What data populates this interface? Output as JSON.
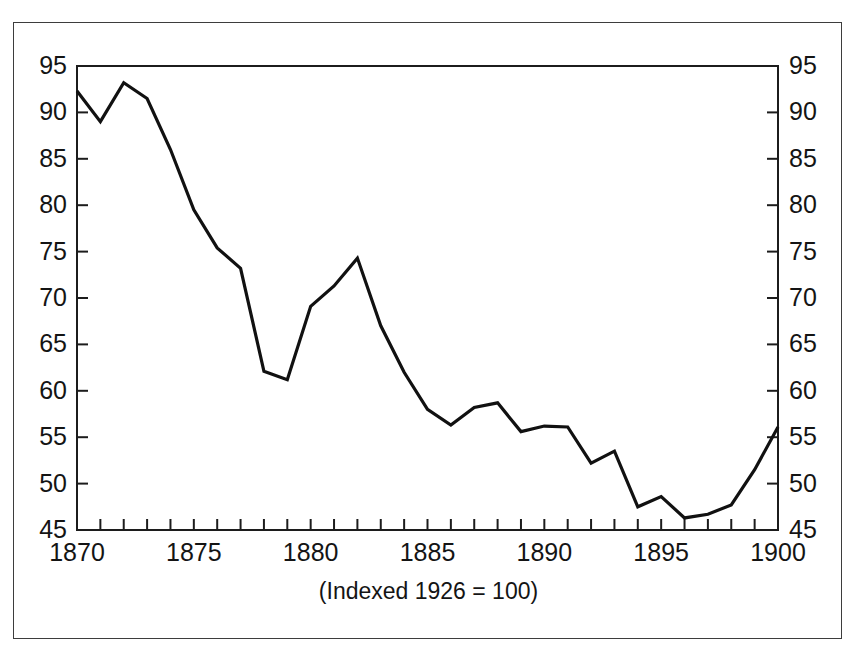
{
  "chart_data": {
    "type": "line",
    "title": "",
    "subtitle": "",
    "caption": "(Indexed 1926 = 100)",
    "xlabel": "",
    "ylabel": "",
    "xlim": [
      1870,
      1900
    ],
    "ylim": [
      45,
      95
    ],
    "grid": false,
    "legend": null,
    "legend_position": "none",
    "line_color": "#111111",
    "line_width": 3.2,
    "x_major_ticks": [
      1870,
      1875,
      1880,
      1885,
      1890,
      1895,
      1900
    ],
    "x_major_tick_labels": [
      "1870",
      "1875",
      "1880",
      "1885",
      "1890",
      "1895",
      "1900"
    ],
    "x_minor_tick_step": 1,
    "y_ticks": [
      45,
      50,
      55,
      60,
      65,
      70,
      75,
      80,
      85,
      90,
      95
    ],
    "y_tick_labels_left": [
      "45",
      "50",
      "55",
      "60",
      "65",
      "70",
      "75",
      "80",
      "85",
      "90",
      "95"
    ],
    "y_tick_labels_right": [
      "45",
      "50",
      "55",
      "60",
      "65",
      "70",
      "75",
      "80",
      "85",
      "90",
      "95"
    ],
    "axes": {
      "left_axis": "visible",
      "right_axis": "visible",
      "top_axis": "visible",
      "bottom_axis": "visible"
    },
    "x": [
      1870,
      1871,
      1872,
      1873,
      1874,
      1875,
      1876,
      1877,
      1878,
      1879,
      1880,
      1881,
      1882,
      1883,
      1884,
      1885,
      1886,
      1887,
      1888,
      1889,
      1890,
      1891,
      1892,
      1893,
      1894,
      1895,
      1896,
      1897,
      1898,
      1899,
      1900
    ],
    "values": [
      92.3,
      89.0,
      93.2,
      91.5,
      86.0,
      79.5,
      75.4,
      73.2,
      62.1,
      61.2,
      69.1,
      71.3,
      74.3,
      67.0,
      62.0,
      58.0,
      56.3,
      58.2,
      58.7,
      55.6,
      56.2,
      56.1,
      52.2,
      53.5,
      47.5,
      48.6,
      46.3,
      46.7,
      47.7,
      51.5,
      56.1
    ],
    "series": [
      {
        "name": "index",
        "values": [
          92.3,
          89.0,
          93.2,
          91.5,
          86.0,
          79.5,
          75.4,
          73.2,
          62.1,
          61.2,
          69.1,
          71.3,
          74.3,
          67.0,
          62.0,
          58.0,
          56.3,
          58.2,
          58.7,
          55.6,
          56.2,
          56.1,
          52.2,
          53.5,
          47.5,
          48.6,
          46.3,
          46.7,
          47.7,
          51.5,
          56.1
        ]
      }
    ]
  },
  "labels": {
    "y_left": [
      "95",
      "90",
      "85",
      "80",
      "75",
      "70",
      "65",
      "60",
      "55",
      "50",
      "45"
    ],
    "y_right": [
      "95",
      "90",
      "85",
      "80",
      "75",
      "70",
      "65",
      "60",
      "55",
      "50",
      "45"
    ],
    "x": [
      "1870",
      "1875",
      "1880",
      "1885",
      "1890",
      "1895",
      "1900"
    ],
    "caption": "(Indexed 1926 = 100)"
  }
}
